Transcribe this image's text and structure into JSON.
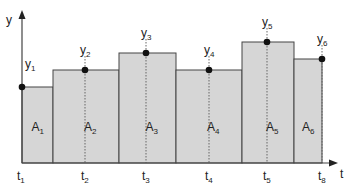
{
  "diagram": {
    "type": "step-function-area-approximation",
    "axes": {
      "y_label": "y",
      "x_label": "t",
      "origin_px": [
        22,
        163
      ],
      "y_arrow_top_px": 10,
      "x_arrow_right_px": 338
    },
    "colors": {
      "bar_fill": "#d6d6d6",
      "bar_stroke": "#444444",
      "axis": "#444444",
      "point": "#111111",
      "dotted": "#666666"
    },
    "bars": [
      {
        "area_label": "A",
        "area_sub": "1",
        "x0": 22,
        "x1": 53,
        "top": 87
      },
      {
        "area_label": "A",
        "area_sub": "2",
        "x0": 53,
        "x1": 119,
        "top": 70
      },
      {
        "area_label": "A",
        "area_sub": "3",
        "x0": 119,
        "x1": 176,
        "top": 53
      },
      {
        "area_label": "A",
        "area_sub": "4",
        "x0": 176,
        "x1": 242,
        "top": 70
      },
      {
        "area_label": "A",
        "area_sub": "5",
        "x0": 242,
        "x1": 294,
        "top": 42
      },
      {
        "area_label": "A",
        "area_sub": "6",
        "x0": 294,
        "x1": 322,
        "top": 59
      }
    ],
    "points": [
      {
        "y_label": "y",
        "y_sub": "1",
        "t_label": "t",
        "t_sub": "1",
        "x": 22,
        "y": 87
      },
      {
        "y_label": "y",
        "y_sub": "2",
        "t_label": "t",
        "t_sub": "2",
        "x": 85,
        "y": 70
      },
      {
        "y_label": "y",
        "y_sub": "3",
        "t_label": "t",
        "t_sub": "3",
        "x": 146,
        "y": 53
      },
      {
        "y_label": "y",
        "y_sub": "4",
        "t_label": "t",
        "t_sub": "4",
        "x": 209,
        "y": 70
      },
      {
        "y_label": "y",
        "y_sub": "5",
        "t_label": "t",
        "t_sub": "5",
        "x": 267,
        "y": 42
      },
      {
        "y_label": "y",
        "y_sub": "6",
        "t_label": "t",
        "t_sub": "8",
        "x": 322,
        "y": 59
      }
    ]
  }
}
